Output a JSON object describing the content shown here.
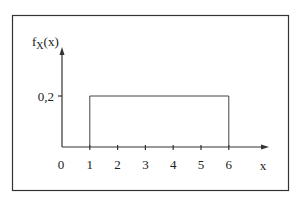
{
  "chart_data": {
    "type": "line",
    "title": "",
    "ylabel_main": "f",
    "ylabel_sub": "X",
    "ylabel_suffix": "(x)",
    "xlabel": "x",
    "xlim": [
      0,
      7
    ],
    "ylim": [
      0,
      0.3
    ],
    "x_ticks": [
      0,
      1,
      2,
      3,
      4,
      5,
      6
    ],
    "x_tick_labels": [
      "0",
      "1",
      "2",
      "3",
      "4",
      "5",
      "6"
    ],
    "y_ticks": [
      0.2
    ],
    "y_tick_labels": [
      "0,2"
    ],
    "series": [
      {
        "name": "uniform density",
        "x": [
          1,
          1,
          6,
          6
        ],
        "y": [
          0,
          0.2,
          0.2,
          0
        ]
      }
    ],
    "grid": false,
    "legend": "none"
  },
  "colors": {
    "axis": "#333333",
    "line": "#444444",
    "frame": "#333333"
  }
}
